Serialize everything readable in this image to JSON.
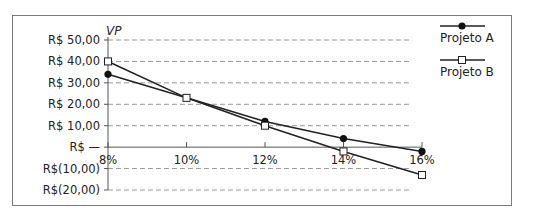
{
  "chart_data": {
    "type": "line",
    "title": "",
    "xlabel": "",
    "ylabel": "VP",
    "categories": [
      "8%",
      "10%",
      "12%",
      "14%",
      "16%"
    ],
    "x": [
      8,
      10,
      12,
      14,
      16
    ],
    "series": [
      {
        "name": "Projeto A",
        "marker": "filled-circle",
        "values": [
          34,
          23,
          12,
          4,
          -2
        ]
      },
      {
        "name": "Projeto B",
        "marker": "open-square",
        "values": [
          40,
          23,
          10,
          -2,
          -13
        ]
      }
    ],
    "yticks": [
      50,
      40,
      30,
      20,
      10,
      0,
      -10,
      -20
    ],
    "ytick_labels": [
      "R$ 50,00",
      "R$ 40,00",
      "R$ 30,00",
      "R$ 20,00",
      "R$ 10,00",
      "R$ —",
      "R$(10,00)",
      "R$(20,00)"
    ],
    "ylim": [
      -20,
      50
    ],
    "xlim": [
      8,
      16
    ],
    "grid": "horizontal dashed",
    "legend_position": "right"
  },
  "colors": {
    "line": "#222222",
    "grid": "#9a9a9a",
    "frame": "#7a7a7a"
  }
}
